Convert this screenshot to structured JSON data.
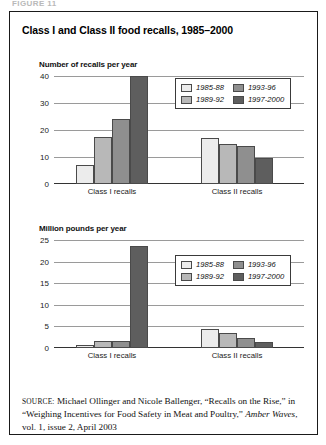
{
  "cut_header_text": "FIGURE 11",
  "figure": {
    "title": "Class I and Class II food recalls, 1985–2000"
  },
  "legend": {
    "entries": [
      {
        "label": "1985-88",
        "color": "#ececec"
      },
      {
        "label": "1993-96",
        "color": "#8f8f8f"
      },
      {
        "label": "1989-92",
        "color": "#b8b8b8"
      },
      {
        "label": "1997-2000",
        "color": "#5e5e5e"
      }
    ]
  },
  "source": {
    "label": "SOURCE:",
    "text_before_italic": " Michael Ollinger and Nicole Ballenger, “Recalls on the Rise,” in “Weighing Incentives for Food Safety in Meat and Poultry,” ",
    "italic_title": "Amber Waves",
    "text_after_italic": ", vol. 1, issue 2, April 2003"
  },
  "chart_data": [
    {
      "type": "bar",
      "title": "Number of recalls per year",
      "ylabel": "Number of recalls per year",
      "xlabel": "",
      "categories": [
        "Class I recalls",
        "Class II recalls"
      ],
      "series": [
        {
          "name": "1985-88",
          "color": "#ececec",
          "values": [
            7,
            17
          ]
        },
        {
          "name": "1989-92",
          "color": "#b8b8b8",
          "values": [
            17.5,
            15
          ]
        },
        {
          "name": "1993-96",
          "color": "#8f8f8f",
          "values": [
            24,
            14
          ]
        },
        {
          "name": "1997-2000",
          "color": "#5e5e5e",
          "values": [
            40,
            9.5
          ]
        }
      ],
      "ylim": [
        0,
        40
      ],
      "yticks": [
        0,
        10,
        20,
        30,
        40
      ],
      "grid": true,
      "legend_position": "top-right"
    },
    {
      "type": "bar",
      "title": "Million pounds per year",
      "ylabel": "Million pounds per year",
      "xlabel": "",
      "categories": [
        "Class I recalls",
        "Class II recalls"
      ],
      "series": [
        {
          "name": "1985-88",
          "color": "#ececec",
          "values": [
            0.7,
            4.3
          ]
        },
        {
          "name": "1989-92",
          "color": "#b8b8b8",
          "values": [
            1.6,
            3.4
          ]
        },
        {
          "name": "1993-96",
          "color": "#8f8f8f",
          "values": [
            1.6,
            2.4
          ]
        },
        {
          "name": "1997-2000",
          "color": "#5e5e5e",
          "values": [
            23.7,
            1.5
          ]
        }
      ],
      "ylim": [
        0,
        25
      ],
      "yticks": [
        0,
        5,
        10,
        15,
        20,
        25
      ],
      "grid": true,
      "legend_position": "top-right"
    }
  ]
}
